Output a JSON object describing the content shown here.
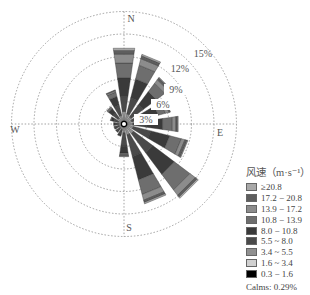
{
  "chart_data": {
    "type": "windrose",
    "title": "",
    "center": [
      124,
      124
    ],
    "px_per_percent": 7.5,
    "rings_percent": [
      3,
      6,
      9,
      12,
      15
    ],
    "ring_labels": [
      "3%",
      "6%",
      "9%",
      "12%",
      "15%"
    ],
    "directions_cardinal": [
      "N",
      "E",
      "S",
      "W"
    ],
    "sectors": 16,
    "directions": [
      "N",
      "NNE",
      "NE",
      "ENE",
      "E",
      "ESE",
      "SE",
      "SSE",
      "S",
      "SSW",
      "SW",
      "WSW",
      "W",
      "WNW",
      "NW",
      "NNW"
    ],
    "legend_title": "风速（m·s⁻¹）",
    "bins": [
      "≥20.8",
      "17.2 − 20.8",
      "13.9 − 17.2",
      "10.8 − 13.9",
      "8.0 − 10.8",
      "5.5 ~ 8.0",
      "3.4 ~ 5.5",
      "1.6 ~ 3.4",
      "0.3 − 1.6"
    ],
    "bin_colors": [
      "#a8a8a8",
      "#5e5e5e",
      "#8c8c8c",
      "#6e6e6e",
      "#3a3a3a",
      "#4a4a4a",
      "#909090",
      "#c8c8c8",
      "#000000"
    ],
    "series": [
      {
        "name": "0.3 − 1.6",
        "values": [
          0.1,
          0.1,
          0.1,
          0.1,
          0.1,
          0.1,
          0.1,
          0.1,
          0.1,
          0.1,
          0.1,
          0.1,
          0.1,
          0.1,
          0.1,
          0.1
        ]
      },
      {
        "name": "1.6 ~ 3.4",
        "values": [
          0.4,
          0.3,
          0.3,
          0.3,
          0.3,
          0.3,
          0.3,
          0.3,
          0.3,
          0.3,
          0.2,
          0.2,
          0.2,
          0.2,
          0.3,
          0.3
        ]
      },
      {
        "name": "3.4 ~ 5.5",
        "values": [
          1.2,
          1.0,
          0.8,
          0.7,
          0.8,
          0.9,
          1.2,
          1.1,
          0.8,
          0.4,
          0.4,
          0.4,
          0.4,
          0.5,
          0.6,
          0.8
        ]
      },
      {
        "name": "5.5 ~ 8.0",
        "values": [
          2.0,
          2.2,
          2.0,
          1.6,
          1.8,
          2.4,
          3.2,
          3.0,
          1.8,
          0.6,
          0.5,
          0.5,
          0.5,
          0.6,
          0.9,
          1.4
        ]
      },
      {
        "name": "8.0 − 10.8",
        "values": [
          2.5,
          2.6,
          2.2,
          2.0,
          2.2,
          2.6,
          3.6,
          3.2,
          0.9,
          0.3,
          0.2,
          0.2,
          0.2,
          0.4,
          0.7,
          1.2
        ]
      },
      {
        "name": "10.8 − 13.9",
        "values": [
          2.0,
          1.9,
          1.4,
          1.0,
          1.3,
          1.6,
          2.6,
          2.0,
          0.3,
          0.0,
          0.0,
          0.0,
          0.0,
          0.1,
          0.3,
          0.6
        ]
      },
      {
        "name": "13.9 − 17.2",
        "values": [
          1.2,
          0.9,
          0.6,
          0.5,
          0.5,
          0.5,
          0.9,
          0.8,
          0.1,
          0.0,
          0.0,
          0.0,
          0.0,
          0.0,
          0.0,
          0.2
        ]
      },
      {
        "name": "17.2 − 20.8",
        "values": [
          0.5,
          0.4,
          0.3,
          0.2,
          0.2,
          0.3,
          0.3,
          0.3,
          0.0,
          0.0,
          0.0,
          0.0,
          0.0,
          0.0,
          0.0,
          0.1
        ]
      },
      {
        "name": "≥20.8",
        "values": [
          0.3,
          0.2,
          0.1,
          0.0,
          0.1,
          0.1,
          0.2,
          0.2,
          0.1,
          0.0,
          0.0,
          0.0,
          0.0,
          0.0,
          0.0,
          0.0
        ]
      }
    ],
    "totals_percent": [
      10.2,
      9.6,
      7.8,
      6.4,
      7.3,
      8.8,
      12.4,
      11.0,
      4.5,
      1.8,
      1.4,
      1.4,
      1.4,
      1.9,
      2.9,
      4.7
    ],
    "calms": "Calms: 0.29%",
    "grid": true,
    "legend_position": "right-bottom"
  },
  "legend": {
    "title": "风速（m·s⁻¹）",
    "items": [
      {
        "label": "≥20.8",
        "color": "#a8a8a8"
      },
      {
        "label": "17.2 − 20.8",
        "color": "#5e5e5e"
      },
      {
        "label": "13.9 − 17.2",
        "color": "#8c8c8c"
      },
      {
        "label": "10.8 − 13.9",
        "color": "#6e6e6e"
      },
      {
        "label": "8.0 − 10.8",
        "color": "#3a3a3a"
      },
      {
        "label": "5.5 ~ 8.0",
        "color": "#4a4a4a"
      },
      {
        "label": "3.4 ~ 5.5",
        "color": "#909090"
      },
      {
        "label": "1.6 ~ 3.4",
        "color": "#d0d0d0"
      },
      {
        "label": "0.3 − 1.6",
        "color": "#000000"
      }
    ],
    "calms": "Calms: 0.29%"
  }
}
